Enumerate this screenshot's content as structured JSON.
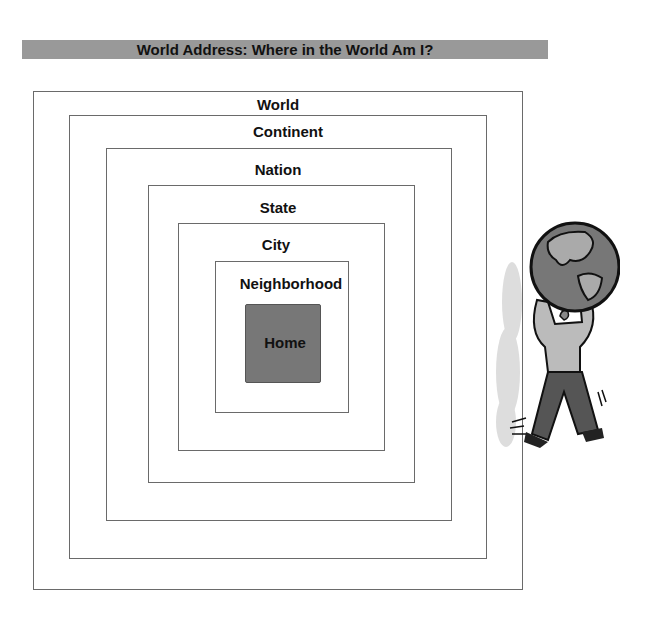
{
  "title": "World Address: Where in the World Am I?",
  "levels": [
    {
      "label": "World"
    },
    {
      "label": "Continent"
    },
    {
      "label": "Nation"
    },
    {
      "label": "State"
    },
    {
      "label": "City"
    },
    {
      "label": "Neighborhood"
    },
    {
      "label": "Home"
    }
  ],
  "illustration": {
    "name": "person-carrying-globe"
  },
  "colors": {
    "title_bar": "#999999",
    "home_fill": "#777777",
    "box_border": "#6a6a6a"
  }
}
